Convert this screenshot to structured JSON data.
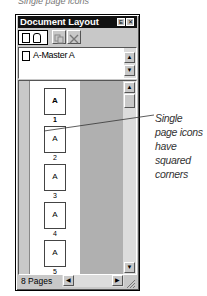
{
  "caption_top": "Single page icons",
  "window": {
    "title": "Document Layout",
    "title_buttons": [
      {
        "name": "collapse",
        "glyph": "E"
      },
      {
        "name": "close",
        "glyph": "✕"
      }
    ],
    "toolbar": [
      {
        "name": "single-page-icon-button",
        "icon": "single-page"
      },
      {
        "name": "facing-page-icon-button",
        "icon": "facing-page"
      },
      {
        "name": "duplicate-button",
        "icon": "duplicate"
      },
      {
        "name": "delete-button",
        "icon": "delete",
        "glyph": "✕"
      }
    ],
    "master_list": {
      "items": [
        {
          "label": "A-Master A"
        }
      ]
    },
    "pages": [
      {
        "letter": "A",
        "number": "1",
        "bold": true
      },
      {
        "letter": "A",
        "number": "2"
      },
      {
        "letter": "A",
        "number": "3"
      },
      {
        "letter": "A",
        "number": "4"
      },
      {
        "letter": "A",
        "number": "5"
      }
    ],
    "footer": {
      "page_count": "8 Pages"
    },
    "scroll_glyphs": {
      "up": "▲",
      "down": "▼",
      "left": "◀",
      "right": "▶"
    }
  },
  "callout": {
    "text": "Single page icons have squared corners"
  }
}
